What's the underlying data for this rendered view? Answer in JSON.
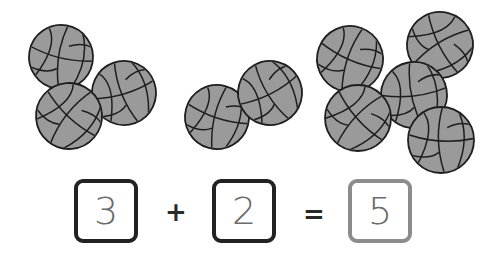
{
  "equation": {
    "addend1": "3",
    "operator_plus": "+",
    "addend2": "2",
    "operator_equals": "=",
    "sum": "5"
  },
  "groups": [
    {
      "name": "group-three",
      "count": 3,
      "balls": [
        {
          "cx": 61,
          "cy": 57,
          "r": 32,
          "rot": 10
        },
        {
          "cx": 124,
          "cy": 93,
          "r": 32,
          "rot": -20
        },
        {
          "cx": 69,
          "cy": 116,
          "r": 33,
          "rot": 40
        }
      ]
    },
    {
      "name": "group-two",
      "count": 2,
      "balls": [
        {
          "cx": 217,
          "cy": 117,
          "r": 32,
          "rot": 15
        },
        {
          "cx": 270,
          "cy": 93,
          "r": 32,
          "rot": -30
        }
      ]
    },
    {
      "name": "group-five",
      "count": 5,
      "balls": [
        {
          "cx": 440,
          "cy": 45,
          "r": 33,
          "rot": 60
        },
        {
          "cx": 414,
          "cy": 95,
          "r": 33,
          "rot": -10
        },
        {
          "cx": 350,
          "cy": 59,
          "r": 33,
          "rot": 20
        },
        {
          "cx": 358,
          "cy": 118,
          "r": 33,
          "rot": 45
        },
        {
          "cx": 441,
          "cy": 140,
          "r": 33,
          "rot": 0
        }
      ]
    }
  ],
  "colors": {
    "ball_fill": "#9a9a9a",
    "ball_line": "#1e1e1e",
    "box_dark": "#222222",
    "box_light": "#8c8c8c",
    "digit": "#6b6b6b"
  }
}
